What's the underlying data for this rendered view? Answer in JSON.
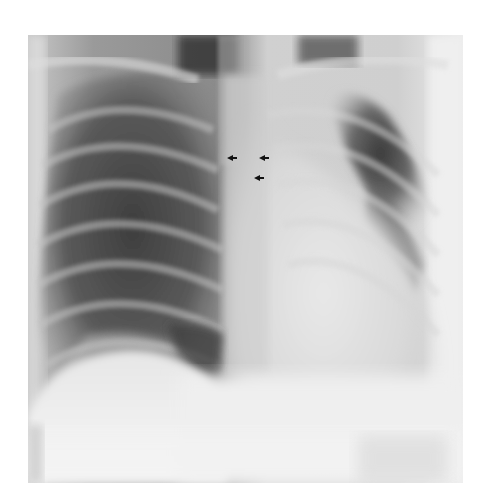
{
  "image": {
    "type": "chest radiograph (PA view)",
    "background_color": "#ffffff",
    "frame": {
      "x": 28,
      "y": 35,
      "width": 435,
      "height": 448
    },
    "markers": [
      {
        "name": "arrow-marker-1",
        "x": 232,
        "y": 158
      },
      {
        "name": "arrow-marker-2",
        "x": 263,
        "y": 158
      },
      {
        "name": "arrow-marker-3",
        "x": 258,
        "y": 178
      }
    ],
    "colors": {
      "lung_dark": "#3a3a3a",
      "lung_mid": "#6e6e6e",
      "mediastinum": "#d6d6d6",
      "abdomen": "#f4f4f4",
      "marker": "#111111"
    }
  }
}
